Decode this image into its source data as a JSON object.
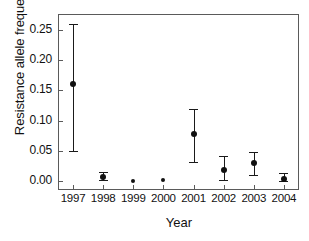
{
  "chart_data": {
    "type": "scatter",
    "title": "",
    "xlabel": "Year",
    "ylabel": "Resistance allele frequency",
    "grid": false,
    "legend": false,
    "categories": [
      "1997",
      "1998",
      "1999",
      "2000",
      "2001",
      "2002",
      "2003",
      "2004"
    ],
    "x": [
      1997,
      1998,
      1999,
      2000,
      2001,
      2002,
      2003,
      2004
    ],
    "values": [
      0.16,
      0.007,
      0.0,
      0.001,
      0.077,
      0.018,
      0.03,
      0.003
    ],
    "error_low": [
      0.05,
      0.002,
      0.0,
      0.001,
      0.032,
      0.002,
      0.01,
      0.0
    ],
    "error_high": [
      0.26,
      0.015,
      0.0,
      0.001,
      0.119,
      0.042,
      0.048,
      0.013
    ],
    "ylim": [
      0.0,
      0.275
    ],
    "yticks": [
      0.0,
      0.05,
      0.1,
      0.15,
      0.2,
      0.25
    ],
    "ytick_labels": [
      "0.00",
      "0.05",
      "0.10",
      "0.15",
      "0.20",
      "0.25"
    ],
    "xtick_labels": [
      "1997",
      "1998",
      "1999",
      "2000",
      "2001",
      "2002",
      "2003",
      "2004"
    ],
    "series_color": "#111111",
    "axis_color": "#5a5a5a"
  },
  "axes": {
    "x_title": "Year",
    "y_title": "Resistance allele frequency"
  }
}
